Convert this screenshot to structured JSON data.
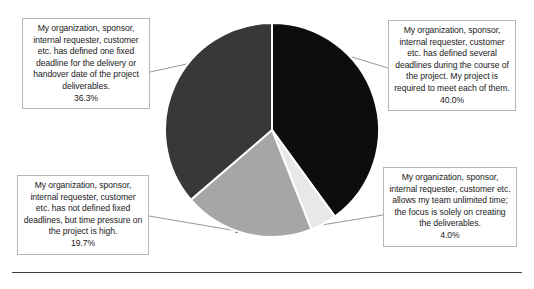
{
  "chart_data": {
    "type": "pie",
    "title": "",
    "categories": [
      "My organization, sponsor, internal requester, customer etc. has defined several deadlines during the course of the project. My project is required to meet each of them.",
      "My organization, sponsor, internal requester, customer etc. allows my team unlimited time; the focus is solely on creating the deliverables.",
      "My organization, sponsor, internal requester, customer etc. has not defined fixed deadlines, but time pressure on the project is high.",
      "My organization, sponsor, internal requester, customer etc. has defined one fixed deadline for the delivery or handover date of the project deliverables."
    ],
    "values": [
      40.0,
      4.0,
      19.7,
      36.3
    ],
    "value_labels": [
      "40.0%",
      "4.0%",
      "19.7%",
      "36.3%"
    ],
    "colors": [
      "#0d0d0d",
      "#e8e8e8",
      "#a6a6a6",
      "#383838"
    ],
    "start_angle_deg": 0,
    "direction": "clockwise",
    "legend": "none",
    "data_labels": "callout boxes with leader lines",
    "xlabel": "",
    "ylabel": ""
  },
  "callouts": {
    "fixed_deadline": {
      "text": "My organization, sponsor, internal requester, customer etc. has defined one fixed deadline for the delivery or handover date of the project deliverables.",
      "percent": "36.3%"
    },
    "several_deadlines": {
      "text": "My organization, sponsor, internal requester, customer etc. has defined several deadlines during the course of the project. My project is required to meet each of them.",
      "percent": "40.0%"
    },
    "no_fixed_deadlines": {
      "text": "My organization, sponsor, internal requester, customer etc. has not defined fixed deadlines, but time pressure on the project is high.",
      "percent": "19.7%"
    },
    "unlimited_time": {
      "text": "My organization, sponsor, internal requester, customer etc. allows my team unlimited time; the focus is solely on creating the deliverables.",
      "percent": "4.0%"
    }
  }
}
